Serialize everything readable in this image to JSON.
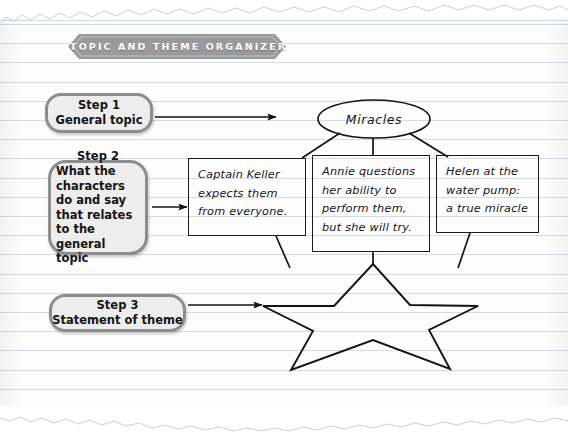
{
  "page": {
    "title": "TOPIC AND THEME ORGANIZER",
    "paper_color": "#fdfdfd",
    "rule_color": "#cdd4dc",
    "banner_color": "#9a9a9a",
    "pill_fill": "#ededed",
    "pill_border": "#8d8d8d",
    "ink_color": "#1a1a1a"
  },
  "steps": [
    {
      "name": "step-1",
      "heading": "Step 1",
      "body": "General topic"
    },
    {
      "name": "step-2",
      "heading": "Step 2",
      "body": "What the characters do and say that relates to the general topic"
    },
    {
      "name": "step-3",
      "heading": "Step 3",
      "body": "Statement of theme"
    }
  ],
  "organizer": {
    "topic": {
      "shape": "oval",
      "text": "Miracles"
    },
    "details": [
      {
        "shape": "rectangle",
        "text": "Captain Keller expects them from everyone."
      },
      {
        "shape": "rectangle",
        "text": "Annie questions her ability to perform them, but she will try."
      },
      {
        "shape": "rectangle",
        "text": "Helen at the water pump: a true miracle"
      }
    ],
    "theme": {
      "shape": "star",
      "text": ""
    }
  }
}
